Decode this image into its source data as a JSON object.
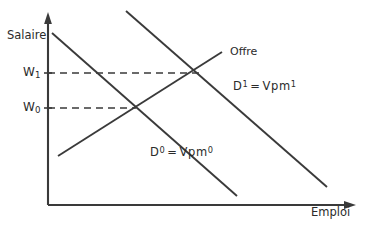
{
  "figure": {
    "type": "economics-supply-demand-diagram",
    "background_color": "#ffffff",
    "stroke_color": "#3a3a3a",
    "text_color": "#2b2b2b",
    "width": 371,
    "height": 230
  },
  "axes": {
    "y": {
      "label": "Salaire",
      "origin": [
        48,
        205
      ],
      "arrow_tip": [
        48,
        14
      ]
    },
    "x": {
      "label": "Emploi",
      "origin": [
        48,
        205
      ],
      "arrow_tip": [
        355,
        205
      ]
    }
  },
  "wage_marks": [
    {
      "name": "W0",
      "label_base": "W",
      "label_sub": "0",
      "y": 108,
      "dash_to_x": 134
    },
    {
      "name": "W1",
      "label_base": "W",
      "label_sub": "1",
      "y": 73,
      "dash_to_x": 197
    }
  ],
  "curves": {
    "supply": {
      "label": "Offre",
      "from": [
        58,
        156
      ],
      "to": [
        222,
        52
      ]
    },
    "demand_0": {
      "label_parts": {
        "d": "D",
        "d_sup": "0",
        "eq": "=",
        "vpm": "Vpm",
        "vpm_sup": "0"
      },
      "label_text": "D0 = Vpm0",
      "from": [
        52,
        33
      ],
      "to": [
        237,
        196
      ]
    },
    "demand_1": {
      "label_parts": {
        "d": "D",
        "d_sup": "1",
        "eq": "=",
        "vpm": "Vpm",
        "vpm_sup": "1"
      },
      "label_text": "D1 = Vpm1",
      "from": [
        126,
        11
      ],
      "to": [
        327,
        187
      ]
    }
  },
  "equilibria": [
    {
      "name": "E0",
      "point": [
        134,
        108
      ],
      "wage": "W0"
    },
    {
      "name": "E1",
      "point": [
        197,
        73
      ],
      "wage": "W1"
    }
  ]
}
